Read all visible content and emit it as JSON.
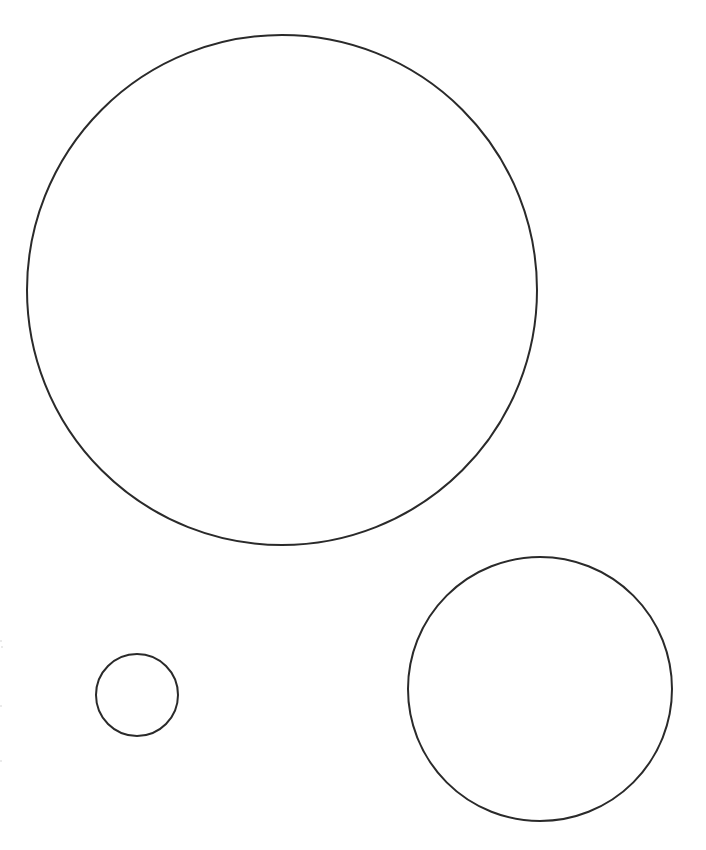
{
  "figure": {
    "title": "Three outlined circles on a white page",
    "background_color": "#ffffff",
    "stroke_color": "#2a2a2a",
    "stroke_width": 2,
    "fill": "none",
    "canvas": {
      "width": 706,
      "height": 850
    }
  },
  "chart_data": {
    "type": "scatter",
    "title": "Three outlined circles on a white page",
    "subtitle": "",
    "xlabel": "",
    "ylabel": "",
    "xlim": [
      0,
      706
    ],
    "ylim": [
      0,
      850
    ],
    "grid": false,
    "legend": "none",
    "units": "pixels",
    "axis_origin": "top-left",
    "categories": [
      "large-circle",
      "medium-circle",
      "small-circle"
    ],
    "values": [
      255,
      132,
      41
    ],
    "series": [
      {
        "name": "radius",
        "values": [
          255,
          132,
          41
        ]
      },
      {
        "name": "diameter",
        "values": [
          510,
          264,
          82
        ]
      },
      {
        "name": "center_x",
        "values": [
          282,
          540,
          137
        ]
      },
      {
        "name": "center_y",
        "values": [
          290,
          689,
          695
        ]
      }
    ],
    "points": [
      {
        "label": "large-circle",
        "cx": 282,
        "cy": 290,
        "r": 255
      },
      {
        "label": "medium-circle",
        "cx": 540,
        "cy": 689,
        "r": 132
      },
      {
        "label": "small-circle",
        "cx": 137,
        "cy": 695,
        "r": 41
      }
    ]
  },
  "shapes": {
    "large": {
      "name": "large-circle",
      "cx": "282",
      "cy": "290",
      "r": "255",
      "stroke": "#2a2a2a",
      "stroke_width": "2"
    },
    "medium": {
      "name": "medium-circle",
      "cx": "540",
      "cy": "689",
      "r": "132",
      "stroke": "#2a2a2a",
      "stroke_width": "2"
    },
    "small": {
      "name": "small-circle",
      "cx": "137",
      "cy": "695",
      "r": "41",
      "stroke": "#2a2a2a",
      "stroke_width": "2"
    }
  },
  "artifacts": [
    {
      "name": "edge-speck-1",
      "left": "0px",
      "top": "640px"
    },
    {
      "name": "edge-speck-2",
      "left": "1px",
      "top": "646px"
    },
    {
      "name": "edge-speck-3",
      "left": "0px",
      "top": "705px"
    },
    {
      "name": "edge-speck-4",
      "left": "0px",
      "top": "760px"
    }
  ]
}
